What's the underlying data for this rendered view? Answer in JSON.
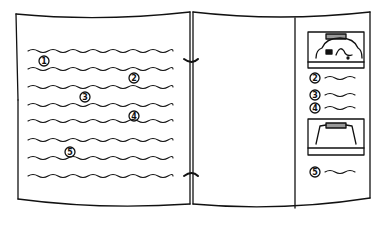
{
  "diagram": {
    "title": "",
    "colors": {
      "line": "#111111",
      "background": "#ffffff",
      "accent_fill": "#999999"
    },
    "left_page": {
      "text_line_count": 10,
      "callouts": [
        {
          "label": "1",
          "x": 44,
          "y": 61
        },
        {
          "label": "2",
          "x": 134,
          "y": 78
        },
        {
          "label": "3",
          "x": 85,
          "y": 97
        },
        {
          "label": "4",
          "x": 134,
          "y": 116
        },
        {
          "label": "5",
          "x": 70,
          "y": 152
        }
      ]
    },
    "binder_rings": [
      {
        "name": "top-ring",
        "y": 60
      },
      {
        "name": "bottom-ring",
        "y": 176
      }
    ],
    "right_panel": {
      "top_device_illustration": "printer-with-paper-path",
      "items": [
        {
          "label": "2",
          "y": 78
        },
        {
          "label": "3",
          "y": 95
        },
        {
          "label": "4",
          "y": 108
        }
      ],
      "bottom_device_illustration": "printer-cover-open",
      "item_after": {
        "label": "5",
        "y": 172
      }
    }
  }
}
